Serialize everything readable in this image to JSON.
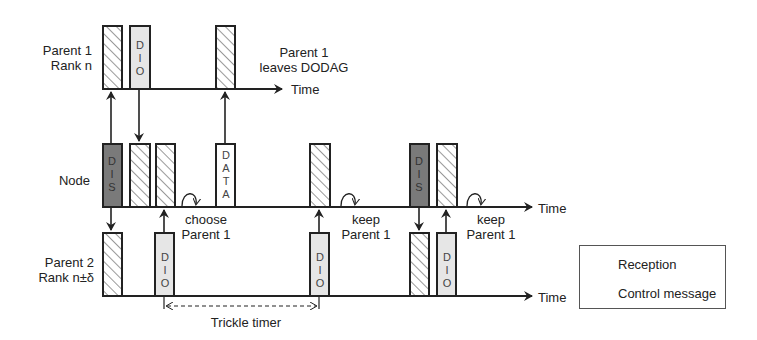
{
  "rows": {
    "parent1": {
      "label_line1": "Parent 1",
      "label_line2": "Rank n"
    },
    "node": {
      "label": "Node"
    },
    "parent2": {
      "label_line1": "Parent 2",
      "label_line2": "Rank n±δ"
    }
  },
  "axis_label": "Time",
  "boxes": {
    "dio": [
      "D",
      "I",
      "O"
    ],
    "dis": [
      "D",
      "I",
      "S"
    ],
    "data": [
      "D",
      "A",
      "T",
      "A"
    ]
  },
  "annotations": {
    "parent1_leaves_line1": "Parent 1",
    "parent1_leaves_line2": "leaves DODAG",
    "choose_line1": "choose",
    "choose_line2": "Parent 1",
    "keep1_line1": "keep",
    "keep1_line2": "Parent 1",
    "keep2_line1": "keep",
    "keep2_line2": "Parent 1",
    "trickle_timer": "Trickle timer"
  },
  "legend": {
    "reception": "Reception",
    "control_message": "Control message"
  },
  "colors": {
    "line": "#222222",
    "control_fill_light": "#e6e6e6",
    "control_fill_dark": "#7a7a7a",
    "hatch": "#555555"
  }
}
